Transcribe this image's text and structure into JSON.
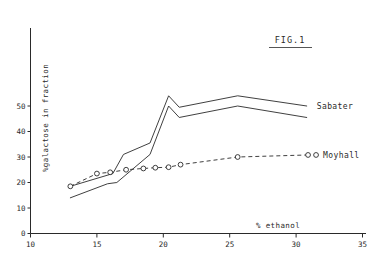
{
  "figure": {
    "caption": "FIG.1"
  },
  "chart_data": {
    "type": "line",
    "title": "FIG.1",
    "xlabel": "% ethanol",
    "ylabel": "%galactose in fraction",
    "xlim": [
      10,
      35
    ],
    "ylim": [
      0,
      57
    ],
    "xticks": [
      10,
      15,
      20,
      25,
      30,
      35
    ],
    "xtick_labels": [
      "10",
      "15",
      "20",
      "25",
      "30",
      "35"
    ],
    "yticks": [
      0,
      10,
      20,
      30,
      40,
      50
    ],
    "ytick_labels": [
      "0",
      "10",
      "20",
      "30",
      "40",
      "50"
    ],
    "grid": false,
    "legend_position": "inline-right",
    "series": [
      {
        "name": "Sabater",
        "label": "Sabater",
        "style": "solid",
        "marker": "none",
        "note": "upper envelope of the Sabater band",
        "x": [
          13.0,
          16.2,
          17.0,
          19.0,
          20.4,
          21.2,
          25.6,
          30.8
        ],
        "y": [
          18.5,
          23.5,
          31.0,
          35.5,
          54.0,
          49.5,
          54.0,
          50.0
        ]
      },
      {
        "name": "Sabater-lower",
        "label": "",
        "style": "solid",
        "marker": "none",
        "note": "lower envelope of the Sabater band",
        "x": [
          13.0,
          15.8,
          16.5,
          19.0,
          20.4,
          21.2,
          25.6,
          30.8
        ],
        "y": [
          14.0,
          19.5,
          20.0,
          31.0,
          50.0,
          45.5,
          50.0,
          45.5
        ]
      },
      {
        "name": "Moyhall",
        "label": "Moyhall",
        "style": "dashed",
        "marker": "open-circle",
        "x": [
          13.0,
          15.0,
          16.0,
          17.2,
          18.5,
          19.4,
          20.4,
          21.3,
          25.6,
          30.9
        ],
        "y": [
          18.5,
          23.5,
          24.0,
          25.0,
          25.5,
          25.8,
          26.0,
          27.0,
          30.0,
          30.8
        ]
      }
    ]
  }
}
